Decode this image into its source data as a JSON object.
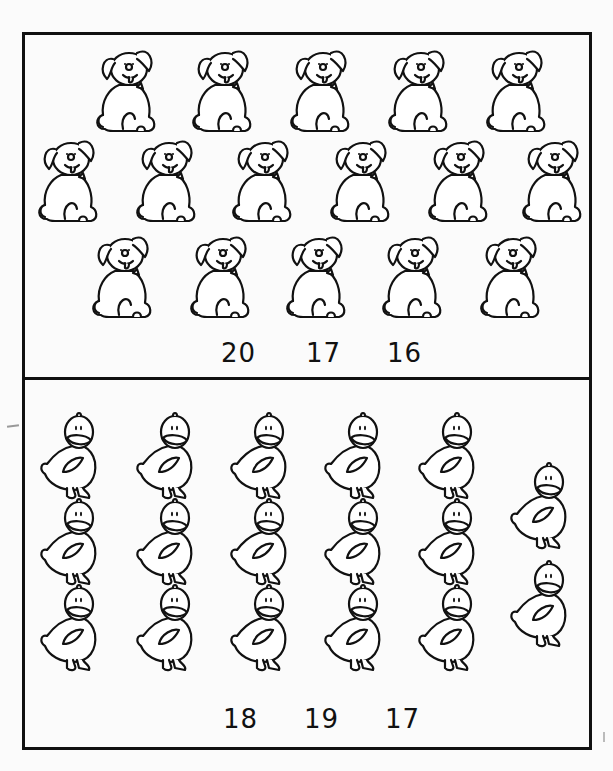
{
  "worksheet": {
    "title": "Counting worksheet",
    "panels": [
      {
        "id": "dogs",
        "animal": "dog",
        "count": 16,
        "rows": [
          5,
          6,
          5
        ],
        "answer_choices": [
          "20",
          "17",
          "16"
        ]
      },
      {
        "id": "ducks",
        "animal": "duck",
        "count": 17,
        "rows": [
          5,
          5,
          5
        ],
        "extra_column": 2,
        "answer_choices": [
          "18",
          "19",
          "17"
        ]
      }
    ]
  },
  "colors": {
    "ink": "#111111",
    "paper": "#fbfbfb"
  }
}
